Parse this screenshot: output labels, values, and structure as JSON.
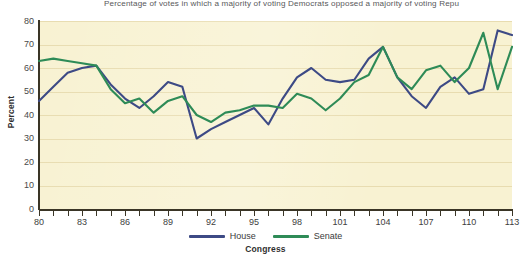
{
  "chart_data": {
    "type": "line",
    "title": "Percentage of votes in which a majority of voting Democrats opposed a majority of voting Repu",
    "xlabel": "Congress",
    "ylabel": "Percent",
    "ylim": [
      0,
      80
    ],
    "ytick_step": 10,
    "yticks": [
      80,
      70,
      60,
      50,
      40,
      30,
      20,
      10,
      0
    ],
    "xlim": [
      80,
      113
    ],
    "xticks": [
      80,
      81,
      82,
      83,
      84,
      85,
      86,
      87,
      88,
      89,
      90,
      91,
      92,
      93,
      94,
      95,
      96,
      97,
      98,
      99,
      100,
      101,
      102,
      103,
      104,
      105,
      106,
      107,
      108,
      109,
      110,
      111,
      112,
      113
    ],
    "xtick_labels": [
      80,
      83,
      86,
      89,
      92,
      95,
      98,
      101,
      104,
      107,
      110,
      113
    ],
    "grid": "horizontal",
    "legend_position": "bottom",
    "plot_background": "#f8f2d2",
    "categories": [
      80,
      81,
      82,
      83,
      84,
      85,
      86,
      87,
      88,
      89,
      90,
      91,
      92,
      93,
      94,
      95,
      96,
      97,
      98,
      99,
      100,
      101,
      102,
      103,
      104,
      105,
      106,
      107,
      108,
      109,
      110,
      111,
      112,
      113
    ],
    "series": [
      {
        "name": "House",
        "color": "#3d4a85",
        "values": [
          46,
          52,
          58,
          60,
          61,
          53,
          47,
          43,
          48,
          54,
          52,
          30,
          34,
          37,
          40,
          43,
          36,
          47,
          56,
          60,
          55,
          54,
          55,
          64,
          69,
          56,
          48,
          43,
          52,
          56,
          49,
          51,
          76,
          74
        ]
      },
      {
        "name": "Senate",
        "color": "#2e8b57",
        "values": [
          63,
          64,
          63,
          62,
          61,
          51,
          45,
          47,
          41,
          46,
          48,
          40,
          37,
          41,
          42,
          44,
          44,
          43,
          49,
          47,
          42,
          47,
          54,
          57,
          69,
          56,
          51,
          59,
          61,
          54,
          60,
          75,
          51,
          69
        ]
      }
    ]
  },
  "legend": {
    "items": [
      {
        "label": "House",
        "color": "#3d4a85"
      },
      {
        "label": "Senate",
        "color": "#2e8b57"
      }
    ]
  }
}
